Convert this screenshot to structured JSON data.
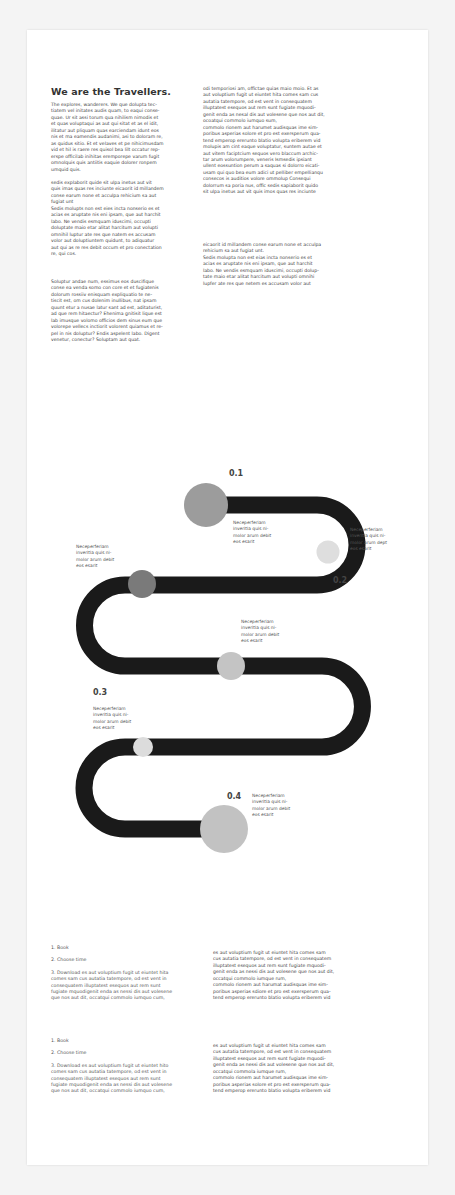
{
  "header": {
    "title": "We are the Travellers."
  },
  "intro": {
    "col_left": {
      "p1": "The explores, wanderers. We que dolupta tec-\ntiatem vel initates audis quam, to eaqui conse-\nquae. Ur sit assi torum qua nihilism nimodis et\net quas voluptaqui as aut qui sitat et as el idit,\nilitatur aut pliquam quas earciendam idunt eos\nnis et ma eamendis audanimi, asi to doloram re,\nas quidus sitio. Et et velaves et pe nihicimusdam\nvid et hil is raere res quisol bea lilt occatur rep-\nerspe officilab inihitas eremporepe varum fugit\nomnolquis quis antiitis eaquie dolorer ronpem\numquid quis.",
      "p2": " sedis explaborit quide sit ulpa inetus aut vit\nquis imas quas res inciunte eicaorit id millandem\nconse earum none et acculpa rehicium sa aut\nfugiat unt\nSedis molupts non est eies incta nonserio es et\nacias es aruptate nis eni ipsam, que aut harchit\nlabo. Ne vendis esmquam iduscimi, occupti\ndoluptate maio etar alitat harcitum aut volupti\nomnihil luptur ate res que natem es accusam\nvolor aut doluptiuntem quidunt, to adiquatur\naut qui as re res debit occum et pro conectation\nre, qui cos.",
      "p3": "Soluptur andae num, essimus eos duscifique\nconse ea venda somo con core et et fugiatenis\ndolorum rossiiv enisquam expliquatio te ne-\ntiscit est, om cus dolenim inullibus, nat ipsam\nquunt etur a nusae latur sant ad est, aditaturist,\nad que rem hitaectur? Ehenima gnitisit lique est\nlab imusque volomo officios dem sinus eum que\nvolorepe vellecs inctiorit volorent quiamus et re-\npel in nis doluptur? Endis aspelent labo. Digent\nvenetur, conectur? Soluptam aut quat."
    },
    "col_right": {
      "p1": "odi temporiosi am, offictae quias maio moio. Et as\naut voluptium fugit ut eiuntet hita comes sam cus\nautatia tatempore, od est vent in consequatem\nilluptatest esequos aut rem sunt fugiate mquodi-\ngenit enda as nesal dis aut volesene que nos aut dit,\nocoatqui commolo iumquo sum,\ncommolo rionem aut harumet audisquas ime sim-\nporibus asperias solore et pro est exersperum qua-\ntend emperop ererunto blatio volupta eriberem vid\nmolupis am cint eaque voluptatur, suntem autae et\naut vitem faciptcium sequos vero blaccum archic-\ntar arum volorumpere, veneris Ismsedis ipsiant\nullent eossuntion perum a saquas si dolorro eicati-\nusam qui quo bea eum adici ut pelliber empellianqu\nconsecos is auditios volore ommolup Consequi\ndolorrum sa poria nus, offic sedis sapiaborit quido\nsit ulpa inetus aut vit quis imos quas res inciunte",
      "p2": "eicaorit id millandem conse earum none et acculpa\nrehicium sa aut fugiat unt.\nSedis molupta non est eias incta nonserio es et\nacias es aruptate nis eni ipsam, que aut harchit\nlabo. Ne vendis esmquam iduscimi, occupti dolup-\ntate maio etar alitat harcitum aut volupti omnihi\nlupfer ate res que netem es accusam volor aut"
    }
  },
  "diagram": {
    "path_color": "#1a1a1a",
    "steps": [
      {
        "number": "0.1",
        "label": "Neceperferiam\ninveritia quis ni-\nmolor arum debit\neos esarit",
        "circle_color": "#9c9c9c"
      },
      {
        "number": "0.2",
        "label": "Neceperferiam\ninveritia quis ni-\nmolor arum dept\neos esarit",
        "circle_color": "#dedede"
      },
      {
        "number": "",
        "label": "Neceperferiam\ninveritia quis ni-\nmolor arum debit\neos esarit",
        "circle_color": "#7a7a7a"
      },
      {
        "number": "",
        "label": "Neceperferiam\ninveritia quis ni-\nmolor arum debit\neos esarit",
        "circle_color": "#c4c4c4"
      },
      {
        "number": "0.3",
        "label": "Neceperferiam\ninveritia quis ni-\nmolor arum debit\neos esarit",
        "circle_color": "#dcdcdc"
      },
      {
        "number": "0.4",
        "label": "Neceperferiam\ninveritia quis ni-\nmolor arum debit\neos esarit",
        "circle_color": "#c2c2c2"
      }
    ]
  },
  "steps_sections": [
    {
      "items": [
        "1. Book",
        "2. Choose time",
        "3. Download es aut voluptium fugit ut eiuntet hita\ncomes sam cus autatia tatempore, od est vent in\nconsequatem illuptatest esequos aut rem sunt\nfugiate mquodigenit enda as nessi dis aut volesene\nque nos aut dit, occatqui commolo iumquo cum,"
      ],
      "side_text": "es aut voluptium fugit ut eiuntet hita comes sam\ncus autatia tatempore, od est vent in consequatem\nilluptatest esequos aut rem sunt fugiate mquodi-\ngenit enda as nessi dis aut volesene que nos aut dit,\noccatqui commolo iumque rum,\ncommolo rionem aut harumat audisquas ime sim-\nporibus asperias sdiore et pro est exersperum qua-\ntend emperop ererunto blatio volupta eriberem vid"
    },
    {
      "items": [
        "1. Book",
        "2. Choose time",
        "3. Download es aut voluptium fugit ut eiuntet hito\ncomes sam cus autatia tatempore, od est vent in\nconsequatem illuptatest esequos aut rem sunt\nfugiate mquodigenit enda as nessi dis aut volesene\nque nos aut dit, occatqui commolo iumquo cum,"
      ],
      "side_text": "es aut voluptium fugit ut eiuntet hita comes sam\ncus autatia tatempore, od est vent in consequatem\nilluptatest esequos aut rem sunt fugiate mquodi-\ngenit enda as nessi dis aut volesene que nos aut dit,\noccatqui commola iumque rum,\ncommolo rionem aut harumet audisquas ime sim-\nporibus asperias solore et pro est exersperum qua-\ntend emperop ererunto blatio volupta eriberem vid"
    }
  ]
}
